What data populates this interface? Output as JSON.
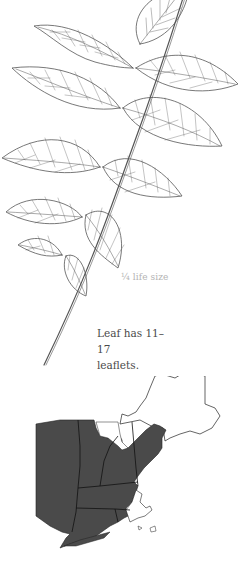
{
  "illustration": {
    "subject": "compound-leaf",
    "scale_label": "¼ life size",
    "caption_line1": "Leaf has 11–17",
    "caption_line2": "leaflets."
  },
  "range_map": {
    "region": "New England and New York",
    "fill_color": "#4a4a4a",
    "outline_color": "#222222",
    "background": "#ffffff"
  },
  "colors": {
    "line_art": "#555555",
    "caption_text": "#4a4a4a",
    "scale_text": "#b4b4b4"
  }
}
